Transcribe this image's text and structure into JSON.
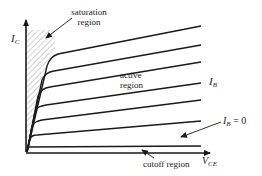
{
  "axes": {
    "y_label": "I",
    "y_label_sub": "C",
    "x_label": "V",
    "x_label_sub": "CE"
  },
  "annotations": {
    "saturation_line1": "saturation",
    "saturation_line2": "region",
    "active_line1": "active",
    "active_line2": "region",
    "ib_label": "I",
    "ib_label_sub": "B",
    "ib_zero_label": "I",
    "ib_zero_sub": "B",
    "ib_zero_eq": " = 0",
    "cutoff": "cutoff region"
  },
  "curves": {
    "count": 7,
    "description": "Family of I_C vs V_CE curves for increasing I_B; lowest curve is I_B = 0",
    "end_y_px": [
      26,
      45,
      62,
      83,
      100,
      121,
      146
    ]
  },
  "colors": {
    "line": "#1a1a1a",
    "hatch": "#8a8a8a",
    "text": "#222222"
  }
}
